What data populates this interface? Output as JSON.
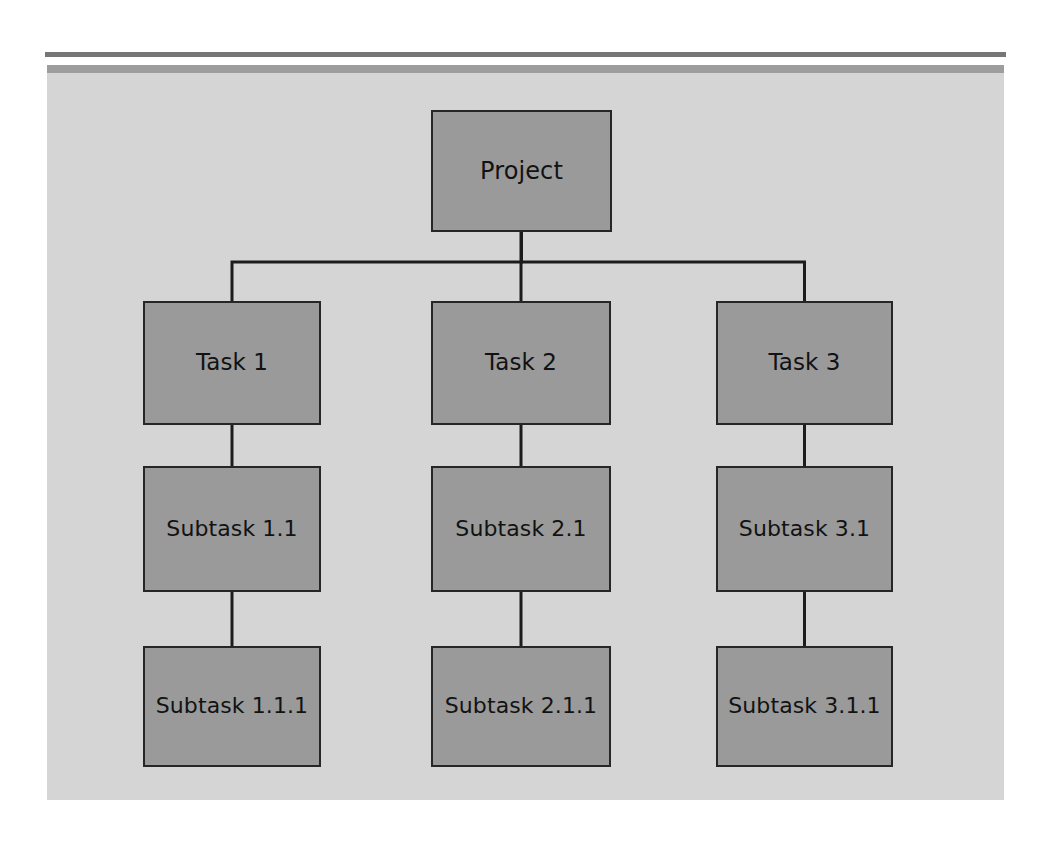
{
  "document": {
    "title": "Project Work Breakdown Structure",
    "background_color": "#ffffff"
  },
  "decor": {
    "rule_top_color": "#767676",
    "rule_second_color": "#9d9d9d"
  },
  "panel": {
    "background_color": "#d5d5d5",
    "node_fill_color": "#9a9a9a",
    "node_border_color": "#262626",
    "connector_color": "#1c1c1c",
    "label_color": "#121212"
  },
  "chart_data": {
    "type": "diagram",
    "diagram_kind": "hierarchy-tree",
    "orientation": "top-down",
    "levels": 4,
    "nodes": [
      {
        "id": "project",
        "label": "Project",
        "level": 0,
        "parent": null,
        "x": 384,
        "y": 37,
        "w": 181,
        "h": 122
      },
      {
        "id": "task1",
        "label": "Task 1",
        "level": 1,
        "parent": "project",
        "x": 96,
        "y": 228,
        "w": 178,
        "h": 124
      },
      {
        "id": "task2",
        "label": "Task 2",
        "level": 1,
        "parent": "project",
        "x": 384,
        "y": 228,
        "w": 180,
        "h": 124
      },
      {
        "id": "task3",
        "label": "Task 3",
        "level": 1,
        "parent": "project",
        "x": 669,
        "y": 228,
        "w": 177,
        "h": 124
      },
      {
        "id": "subtask1_1",
        "label": "Subtask 1.1",
        "level": 2,
        "parent": "task1",
        "x": 96,
        "y": 393,
        "w": 178,
        "h": 126
      },
      {
        "id": "subtask2_1",
        "label": "Subtask 2.1",
        "level": 2,
        "parent": "task2",
        "x": 384,
        "y": 393,
        "w": 180,
        "h": 126
      },
      {
        "id": "subtask3_1",
        "label": "Subtask 3.1",
        "level": 2,
        "parent": "task3",
        "x": 669,
        "y": 393,
        "w": 177,
        "h": 126
      },
      {
        "id": "subtask1_1_1",
        "label": "Subtask 1.1.1",
        "level": 3,
        "parent": "subtask1_1",
        "x": 96,
        "y": 573,
        "w": 178,
        "h": 121
      },
      {
        "id": "subtask2_1_1",
        "label": "Subtask 2.1.1",
        "level": 3,
        "parent": "subtask2_1",
        "x": 384,
        "y": 573,
        "w": 180,
        "h": 121
      },
      {
        "id": "subtask3_1_1",
        "label": "Subtask 3.1.1",
        "level": 3,
        "parent": "subtask3_1",
        "x": 669,
        "y": 573,
        "w": 177,
        "h": 121
      }
    ],
    "edges": [
      {
        "from": "project",
        "to": "task1",
        "style": "orthogonal"
      },
      {
        "from": "project",
        "to": "task2",
        "style": "straight"
      },
      {
        "from": "project",
        "to": "task3",
        "style": "orthogonal"
      },
      {
        "from": "task1",
        "to": "subtask1_1",
        "style": "straight"
      },
      {
        "from": "task2",
        "to": "subtask2_1",
        "style": "straight"
      },
      {
        "from": "task3",
        "to": "subtask3_1",
        "style": "straight"
      },
      {
        "from": "subtask1_1",
        "to": "subtask1_1_1",
        "style": "straight"
      },
      {
        "from": "subtask2_1",
        "to": "subtask2_1_1",
        "style": "straight"
      },
      {
        "from": "subtask3_1",
        "to": "subtask3_1_1",
        "style": "straight"
      }
    ],
    "trunk": {
      "y": 189,
      "x_start": 185,
      "x_end": 758,
      "drop_x_positions": [
        185,
        474,
        758
      ]
    }
  }
}
